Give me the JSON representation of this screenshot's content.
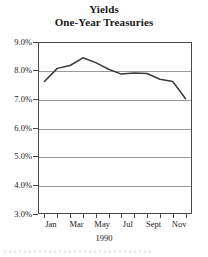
{
  "chart_data": {
    "type": "line",
    "title": "Yields",
    "subtitle": "One-Year Treasuries",
    "xlabel": "1990",
    "ylabel": "",
    "ylim": [
      3.0,
      9.0
    ],
    "ytick_values": [
      9.0,
      8.0,
      7.0,
      6.0,
      5.0,
      4.0,
      3.0
    ],
    "ytick_labels": [
      "9.0%",
      "8.0%",
      "7.0%",
      "6.0%",
      "5.0%",
      "4.0%",
      "3.0%"
    ],
    "grid": true,
    "legend": null,
    "categories": [
      "Jan",
      "Feb",
      "Mar",
      "Apr",
      "May",
      "Jun",
      "Jul",
      "Aug",
      "Sept",
      "Oct",
      "Nov",
      "Dec"
    ],
    "xtick_labels": [
      "Jan",
      "Mar",
      "May",
      "Jul",
      "Sept",
      "Nov"
    ],
    "xtick_label_indices": [
      0,
      2,
      4,
      6,
      8,
      10
    ],
    "values": [
      7.62,
      8.08,
      8.18,
      8.45,
      8.28,
      8.05,
      7.88,
      7.92,
      7.9,
      7.7,
      7.62,
      7.02
    ],
    "line_color": "#3a3a3a",
    "grid_color": "#9a9a9a",
    "axis_color": "#4a4a4a"
  },
  "axis_title_below": "1990"
}
